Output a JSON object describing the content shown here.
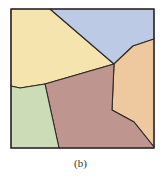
{
  "figure": {
    "caption": "(b)",
    "type": "polygon partition diagram",
    "frame": {
      "x": 11,
      "y": 9,
      "width": 143,
      "height": 139,
      "stroke": "#2f2a28"
    },
    "regions": [
      {
        "name": "region-yellow",
        "color": "#f5e4ae",
        "points": "11,9 50,9 114,64 45,84 20,88 11,86"
      },
      {
        "name": "region-blue",
        "color": "#bccae6",
        "points": "50,9 154,9 154,39 133,46 114,64"
      },
      {
        "name": "region-orange",
        "color": "#eec9a0",
        "points": "114,64 133,46 154,39 154,147 134,122 112,110"
      },
      {
        "name": "region-brown",
        "color": "#bf958f",
        "points": "45,84 114,64 112,110 134,122 154,147 154,148 59,148"
      },
      {
        "name": "region-green",
        "color": "#cbdcb6",
        "points": "11,86 20,88 45,84 59,148 11,148"
      }
    ]
  }
}
